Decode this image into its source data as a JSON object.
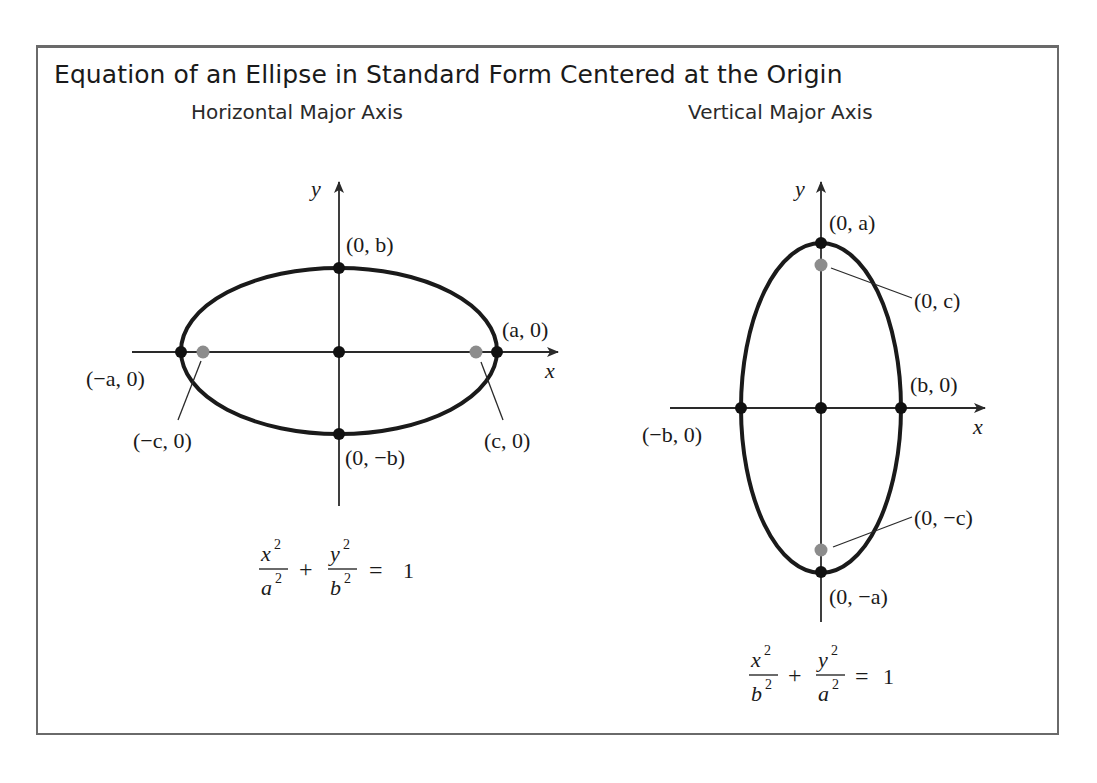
{
  "figure": {
    "title": "Equation of an Ellipse in Standard Form Centered at the Origin",
    "frame_color": "#6a6a6a"
  },
  "panels": [
    {
      "subtitle": "Horizontal Major Axis",
      "axis_labels": {
        "x": "x",
        "y": "y"
      },
      "points": {
        "top_vertex": "(0, b)",
        "bottom_vertex": "(0, −b)",
        "left_vertex": "(−a, 0)",
        "right_vertex": "(a, 0)",
        "left_focus": "(−c, 0)",
        "right_focus": "(c, 0)"
      },
      "equation": {
        "term1_num": "x",
        "term1_den": "a",
        "term2_num": "y",
        "term2_den": "b",
        "exp": "2",
        "plus": "+",
        "equals": "=",
        "rhs": "1"
      }
    },
    {
      "subtitle": "Vertical Major Axis",
      "axis_labels": {
        "x": "x",
        "y": "y"
      },
      "points": {
        "top_vertex": "(0, a)",
        "bottom_vertex": "(0, −a)",
        "left_vertex": "(−b, 0)",
        "right_vertex": "(b, 0)",
        "top_focus": "(0, c)",
        "bottom_focus": "(0, −c)"
      },
      "equation": {
        "term1_num": "x",
        "term1_den": "b",
        "term2_num": "y",
        "term2_den": "a",
        "exp": "2",
        "plus": "+",
        "equals": "=",
        "rhs": "1"
      }
    }
  ],
  "colors": {
    "curve": "#1a1a1a",
    "vertex_dot": "#111111",
    "focus_dot": "#8c8c8c",
    "axis": "#2a2a2a"
  }
}
